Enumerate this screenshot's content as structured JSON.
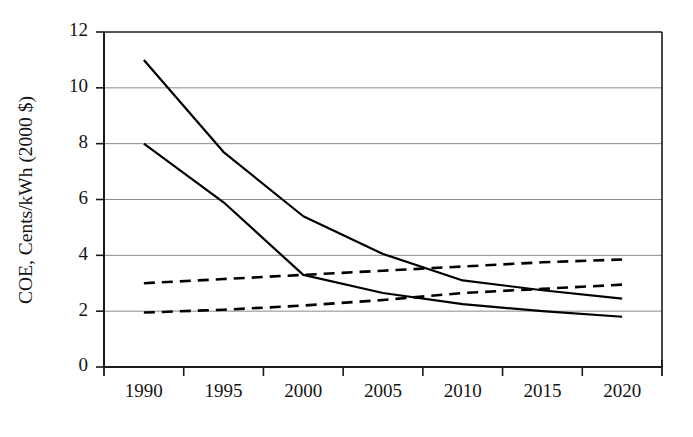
{
  "chart_data": {
    "type": "line",
    "title": "",
    "subtitle": "",
    "xlabel": "",
    "ylabel": "COE, Cents/kWh (2000 $)",
    "x": [
      1990,
      1995,
      2000,
      2005,
      2010,
      2015,
      2020
    ],
    "xtick_labels": [
      "1990",
      "1995",
      "2000",
      "2005",
      "2010",
      "2015",
      "2020"
    ],
    "ytick_labels": [
      "0",
      "2",
      "4",
      "6",
      "8",
      "10",
      "12"
    ],
    "ytick_values": [
      0,
      2,
      4,
      6,
      8,
      10,
      12
    ],
    "xlim": [
      1990,
      2020
    ],
    "ylim": [
      0,
      12
    ],
    "grid": "horizontal",
    "legend": "none",
    "series": [
      {
        "name": "solid-upper",
        "style": "solid",
        "color": "#000000",
        "values": [
          11.0,
          7.7,
          5.4,
          4.05,
          3.1,
          2.75,
          2.45
        ]
      },
      {
        "name": "solid-lower",
        "style": "solid",
        "color": "#000000",
        "values": [
          8.0,
          5.9,
          3.3,
          2.65,
          2.25,
          2.0,
          1.8
        ]
      },
      {
        "name": "dashed-upper",
        "style": "dashed",
        "color": "#000000",
        "values": [
          3.0,
          3.15,
          3.3,
          3.45,
          3.6,
          3.75,
          3.85
        ]
      },
      {
        "name": "dashed-lower",
        "style": "dashed",
        "color": "#000000",
        "values": [
          1.95,
          2.05,
          2.2,
          2.4,
          2.65,
          2.8,
          2.95
        ]
      }
    ]
  },
  "axes": {
    "y_axis_label": "COE, Cents/kWh (2000 $)",
    "y_ticks": [
      "0",
      "2",
      "4",
      "6",
      "8",
      "10",
      "12"
    ],
    "x_ticks": [
      "1990",
      "1995",
      "2000",
      "2005",
      "2010",
      "2015",
      "2020"
    ]
  },
  "colors": {
    "background": "#ffffff",
    "axis": "#1a1a1a",
    "gridline": "#8a8a8a",
    "series": "#000000",
    "text": "#141414"
  }
}
